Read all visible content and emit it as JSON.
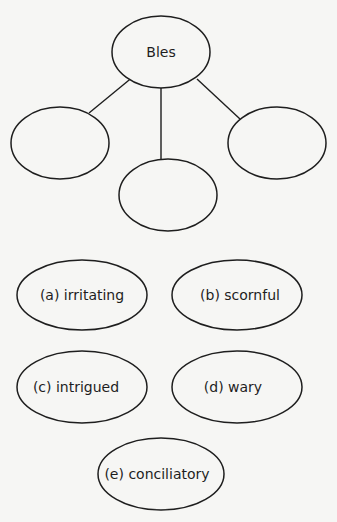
{
  "diagram": {
    "type": "word-web",
    "center": {
      "label": "Bles"
    },
    "branches": [
      {
        "label": ""
      },
      {
        "label": ""
      },
      {
        "label": ""
      }
    ]
  },
  "options": [
    {
      "label": "(a) irritating"
    },
    {
      "label": "(b) scornful"
    },
    {
      "label": "(c) intrigued"
    },
    {
      "label": "(d) wary"
    },
    {
      "label": "(e) conciliatory"
    }
  ],
  "colors": {
    "background": "#f6f6f4",
    "stroke": "#1e1e1e",
    "text": "#1e1e1e"
  }
}
